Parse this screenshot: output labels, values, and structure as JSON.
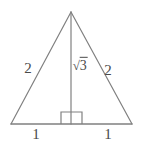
{
  "figure": {
    "kind": "geometry-diagram",
    "shape": "isosceles-triangle-with-altitude",
    "background_color": "#ffffff",
    "stroke_color": "#808080",
    "text_color": "#4a4a4a",
    "stroke_width": 1.2,
    "canvas": {
      "width": 141,
      "height": 144
    },
    "vertices": {
      "apex": {
        "x": 71,
        "y": 12
      },
      "base_left": {
        "x": 11,
        "y": 124
      },
      "base_right": {
        "x": 132,
        "y": 124
      },
      "base_midpoint": {
        "x": 71,
        "y": 124
      }
    },
    "altitude": {
      "from": {
        "x": 71,
        "y": 12
      },
      "to": {
        "x": 71,
        "y": 124
      }
    },
    "right_angle_marker": {
      "x": 61,
      "y": 112,
      "width": 21,
      "height": 12
    },
    "labels": [
      {
        "id": "left-leg",
        "text": "2",
        "x": 28,
        "y": 68
      },
      {
        "id": "right-leg",
        "text": "2",
        "x": 108,
        "y": 70
      },
      {
        "id": "altitude",
        "radical_sign": "√",
        "radicand": "3",
        "x": 80,
        "y": 66
      },
      {
        "id": "left-base",
        "text": "1",
        "x": 36,
        "y": 134
      },
      {
        "id": "right-base",
        "text": "1",
        "x": 108,
        "y": 134
      }
    ]
  }
}
